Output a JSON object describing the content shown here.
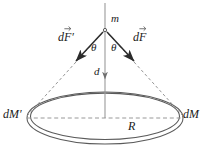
{
  "figure": {
    "background_color": "#ffffff",
    "line_color": "#4d4d4d",
    "dashed_color": "#808080",
    "text_color": "#1a1a1a",
    "labels": {
      "mass": "m",
      "force_right_d": "d",
      "force_right_f": "F",
      "force_left_d": "d",
      "force_left_f": "F",
      "force_left_prime": "′",
      "angle_left": "θ",
      "angle_right": "θ",
      "axial_distance": "d",
      "ring_element_right": "dM",
      "ring_element_left": "dM′",
      "radius": "R"
    },
    "geometry": {
      "apex_x": 105,
      "apex_y": 30,
      "axis_top_y": 3,
      "axis_bottom_y": 118,
      "axis_arrow_y": 79,
      "ring_center_x": 105,
      "ring_center_y": 118,
      "ring_radius_x": 78,
      "ring_radius_y": 26,
      "left_contact_x": 27,
      "right_contact_x": 183,
      "force_left_tip_x": 76,
      "force_left_tip_y": 61,
      "force_right_tip_x": 134,
      "force_right_tip_y": 61
    }
  }
}
